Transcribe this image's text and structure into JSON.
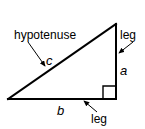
{
  "figure": {
    "background_color": "#ffffff",
    "stroke_color": "#000000",
    "labels": {
      "hypotenuse": "hypotenuse",
      "leg_right": "leg",
      "leg_bottom": "leg",
      "side_c": "c",
      "side_a": "a",
      "side_b": "b"
    },
    "shape": {
      "type": "right triangle",
      "vertices": {
        "left": [
          8,
          99
        ],
        "apex": [
          116,
          24
        ],
        "right_angle": [
          116,
          99
        ]
      },
      "right_angle_marker": true
    },
    "annotations": [
      {
        "name": "hypotenuse-pointer",
        "from": [
          28,
          42
        ],
        "to": [
          46,
          68
        ]
      },
      {
        "name": "leg-right-pointer",
        "from": [
          133,
          43
        ],
        "to": [
          118,
          54
        ]
      },
      {
        "name": "leg-bottom-pointer",
        "from": [
          97,
          112
        ],
        "to": [
          83,
          101
        ]
      }
    ]
  }
}
